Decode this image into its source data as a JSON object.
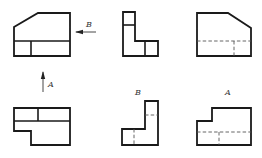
{
  "diagram": {
    "type": "orthographic-projection-exercise",
    "stroke_color": "#1a1a1a",
    "hidden_line_color": "#555555",
    "arrows": {
      "B": {
        "label": "B",
        "direction": "left"
      },
      "A": {
        "label": "A",
        "direction": "up"
      }
    },
    "views": [
      {
        "id": "main-view",
        "row": "top",
        "col": "left",
        "hidden_lines": false
      },
      {
        "id": "left-view",
        "row": "top",
        "col": "middle",
        "hidden_lines": false
      },
      {
        "id": "top-right-view",
        "row": "top",
        "col": "right",
        "hidden_lines": true
      },
      {
        "id": "bottom-view",
        "row": "bottom",
        "col": "left",
        "hidden_lines": false
      },
      {
        "id": "view-b",
        "row": "bottom",
        "col": "middle",
        "label": "B",
        "hidden_lines": true
      },
      {
        "id": "view-a",
        "row": "bottom",
        "col": "right",
        "label": "A",
        "hidden_lines": true
      }
    ],
    "labels": {
      "arrow_b": "B",
      "arrow_a": "A",
      "view_b": "B",
      "view_a": "A"
    }
  }
}
